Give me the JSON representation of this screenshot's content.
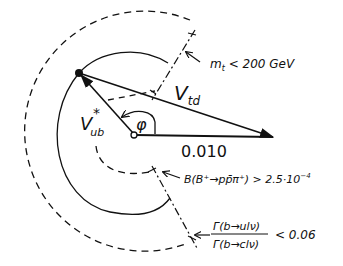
{
  "diagram": {
    "labels": {
      "vtd": "V",
      "vtd_sub": "td",
      "vub": "V",
      "vub_sub": "ub",
      "vub_star": "*",
      "phi": "φ",
      "base_length": "0.010"
    },
    "constraints": {
      "mt": {
        "text_m": "m",
        "text_sub": "t",
        "text_rest": " < 200 GeV"
      },
      "branching": {
        "text": "B(B⁺→pp̄π⁺) > 2.5·10",
        "exponent": "−4"
      },
      "ratio": {
        "numerator": "Γ(b→ulν)",
        "denominator": "Γ(b→clν)",
        "rhs": "< 0.06"
      }
    },
    "colors": {
      "ink": "#111111",
      "background": "#ffffff"
    }
  }
}
